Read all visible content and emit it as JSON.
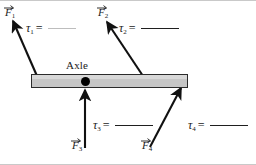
{
  "figure": {
    "background_color": "#ffffff",
    "border_color": "#c9c9c9"
  },
  "axle": {
    "label": "Axle",
    "pivot_color": "#000000",
    "bar_fill": "#c6c6c6",
    "bar_stroke": "#2b2b2b"
  },
  "forces": [
    {
      "id": "F1",
      "symbol": "F",
      "subscript": "1",
      "tail_x": 37,
      "tail_y": 76,
      "head_x": 13,
      "head_y": 21,
      "label_x": 5,
      "label_y": 6
    },
    {
      "id": "F2",
      "symbol": "F",
      "subscript": "2",
      "tail_x": 143,
      "tail_y": 76,
      "head_x": 107,
      "head_y": 22,
      "label_x": 98,
      "label_y": 6
    },
    {
      "id": "F3",
      "symbol": "F",
      "subscript": "3",
      "tail_x": 85,
      "tail_y": 148,
      "head_x": 85,
      "head_y": 90,
      "label_x": 72,
      "label_y": 139
    },
    {
      "id": "F4",
      "symbol": "F",
      "subscript": "4",
      "tail_x": 150,
      "tail_y": 147,
      "head_x": 181,
      "head_y": 88,
      "label_x": 142,
      "label_y": 139
    }
  ],
  "torques": [
    {
      "id": "tau1",
      "symbol": "τ",
      "subscript": "1",
      "equals": "=",
      "blank_width": 28,
      "blank_color": "#bdbdbd",
      "x": 26,
      "y": 21
    },
    {
      "id": "tau2",
      "symbol": "τ",
      "subscript": "2",
      "equals": "=",
      "blank_width": 38,
      "blank_color": "#1f1f1f",
      "x": 119,
      "y": 21
    },
    {
      "id": "tau3",
      "symbol": "τ",
      "subscript": "3",
      "equals": "=",
      "blank_width": 38,
      "blank_color": "#1f1f1f",
      "x": 93,
      "y": 118
    },
    {
      "id": "tau4",
      "symbol": "τ",
      "subscript": "4",
      "equals": "=",
      "blank_width": 38,
      "blank_color": "#1f1f1f",
      "x": 188,
      "y": 118
    }
  ]
}
